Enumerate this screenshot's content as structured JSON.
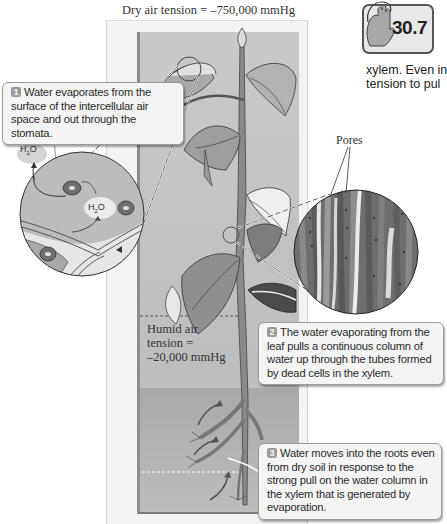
{
  "figure": {
    "top_label": "Dry air tension = –750,000 mmHg",
    "humid_label": {
      "lines": [
        "Humid air",
        "tension =",
        "–20,000 mmHg"
      ]
    },
    "pores_label": "Pores",
    "h2o_label": "H2O",
    "steps": [
      {
        "number": "1",
        "text": "Water evaporates from the surface of the intercellular air space and out through the stomata."
      },
      {
        "number": "2",
        "text": "The water evaporating from the leaf pulls a continuous column of water up through the tubes formed by dead cells in the xylem."
      },
      {
        "number": "3",
        "text": "Water moves into the roots even from dry soil in response to the strong pull on the water column in the xylem that is generated by evaporation."
      }
    ]
  },
  "badge": {
    "number": "30.7",
    "icon": "hand-icon"
  },
  "side_text": {
    "lines": [
      "xylem.  Even in",
      "tension to pul"
    ]
  },
  "colors": {
    "panel_outer": "#f3f3f3",
    "panel_inner": "#c5c5c5",
    "soil": "#adadad",
    "callout_bg": "#f4f4f4",
    "step_badge": "#9c9c9c"
  }
}
